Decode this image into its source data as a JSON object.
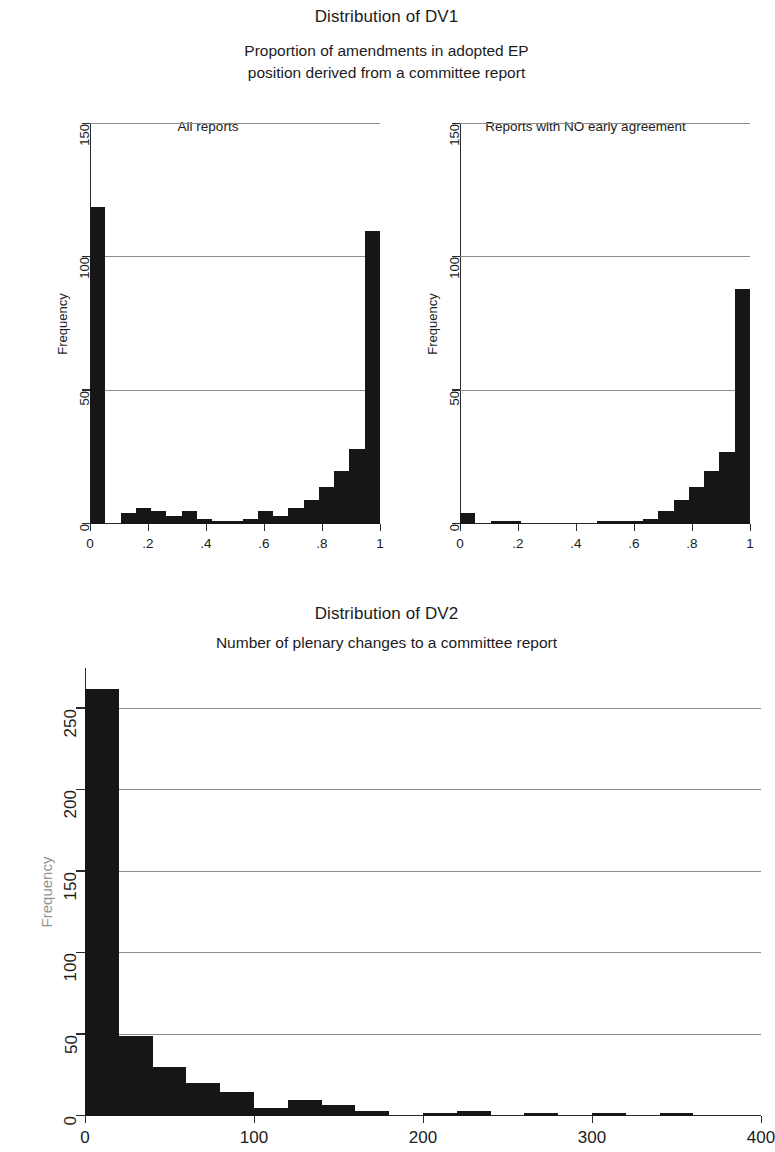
{
  "figure1": {
    "title": "Distribution of DV1",
    "subtitle_line1": "Proportion of amendments in adopted EP",
    "subtitle_line2": "position derived from a committee report",
    "ylabel": "Frequency"
  },
  "figure2": {
    "title": "Distribution of DV2",
    "subtitle": "Number of plenary changes to a committee report",
    "ylabel": "Frequency"
  },
  "chart_data": [
    {
      "type": "bar",
      "subplot": "left",
      "title": "Distribution of DV1",
      "subtitle": "Proportion of amendments in adopted EP position derived from a committee report",
      "panel_title": "All reports",
      "xlabel": "",
      "ylabel": "Frequency",
      "xlim": [
        0,
        1
      ],
      "ylim": [
        0,
        150
      ],
      "xticks": [
        0,
        0.2,
        0.4,
        0.6,
        0.8,
        1
      ],
      "xticklabels": [
        "0",
        ".2",
        ".4",
        ".6",
        ".8",
        "1"
      ],
      "yticks": [
        0,
        50,
        100,
        150
      ],
      "yticklabels": [
        "0",
        "50",
        "100",
        "150"
      ],
      "grid": "horizontal",
      "bin_width": 0.0556,
      "bin_starts": [
        0.0,
        0.0556,
        0.1111,
        0.1667,
        0.2222,
        0.2778,
        0.3333,
        0.3889,
        0.4444,
        0.5,
        0.5556,
        0.6111,
        0.6667,
        0.7222,
        0.7778,
        0.8333,
        0.8889,
        0.9444
      ],
      "values": [
        119,
        0,
        4,
        6,
        5,
        3,
        5,
        2,
        1,
        1,
        2,
        5,
        3,
        6,
        9,
        14,
        20,
        28,
        110
      ],
      "categories": [
        "0.00",
        "0.06",
        "0.11",
        "0.17",
        "0.22",
        "0.28",
        "0.33",
        "0.39",
        "0.44",
        "0.50",
        "0.56",
        "0.61",
        "0.67",
        "0.72",
        "0.78",
        "0.83",
        "0.89",
        "0.94",
        "1.00"
      ]
    },
    {
      "type": "bar",
      "subplot": "right",
      "panel_title": "Reports with NO early agreement",
      "xlabel": "",
      "ylabel": "Frequency",
      "xlim": [
        0,
        1
      ],
      "ylim": [
        0,
        150
      ],
      "xticks": [
        0,
        0.2,
        0.4,
        0.6,
        0.8,
        1
      ],
      "xticklabels": [
        "0",
        ".2",
        ".4",
        ".6",
        ".8",
        "1"
      ],
      "yticks": [
        0,
        50,
        100,
        150
      ],
      "yticklabels": [
        "0",
        "50",
        "100",
        "150"
      ],
      "grid": "horizontal",
      "bin_width": 0.0556,
      "values": [
        4,
        0,
        1,
        1,
        0,
        0,
        0,
        0,
        0,
        1,
        1,
        1,
        2,
        5,
        9,
        14,
        20,
        27,
        88
      ],
      "categories": [
        "0.00",
        "0.06",
        "0.11",
        "0.17",
        "0.22",
        "0.28",
        "0.33",
        "0.39",
        "0.44",
        "0.50",
        "0.56",
        "0.61",
        "0.67",
        "0.72",
        "0.78",
        "0.83",
        "0.89",
        "0.94",
        "1.00"
      ]
    },
    {
      "type": "bar",
      "subplot": "bottom",
      "title": "Distribution of DV2",
      "subtitle": "Number of plenary changes to a committee report",
      "xlabel": "",
      "ylabel": "Frequency",
      "xlim": [
        0,
        400
      ],
      "ylim": [
        0,
        275
      ],
      "xticks": [
        0,
        100,
        200,
        300,
        400
      ],
      "xticklabels": [
        "0",
        "100",
        "200",
        "300",
        "400"
      ],
      "yticks": [
        0,
        50,
        100,
        150,
        200,
        250
      ],
      "yticklabels": [
        "0",
        "50",
        "100",
        "150",
        "200",
        "250"
      ],
      "grid": "horizontal",
      "bin_width": 20,
      "bin_starts": [
        0,
        20,
        40,
        60,
        80,
        100,
        120,
        140,
        160,
        180,
        200,
        220,
        240,
        260,
        280,
        300,
        320,
        340,
        360,
        380
      ],
      "values": [
        262,
        49,
        30,
        20,
        15,
        5,
        10,
        7,
        3,
        0,
        2,
        3,
        0,
        2,
        0,
        2,
        0,
        2,
        0,
        0
      ],
      "categories": [
        "0-20",
        "20-40",
        "40-60",
        "60-80",
        "80-100",
        "100-120",
        "120-140",
        "140-160",
        "160-180",
        "180-200",
        "200-220",
        "220-240",
        "240-260",
        "260-280",
        "280-300",
        "300-320",
        "320-340",
        "340-360",
        "360-380",
        "380-400"
      ]
    }
  ],
  "colors": {
    "bar": "#161616",
    "axis": "#2a2a2a",
    "grid": "#8d8d8d",
    "text": "#1c1c1c",
    "background": "#ffffff"
  }
}
